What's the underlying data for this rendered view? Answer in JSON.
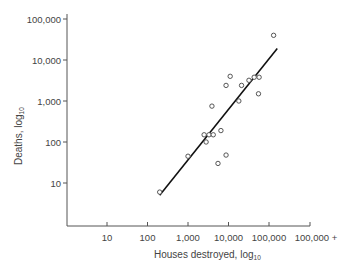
{
  "chart_data": {
    "type": "scatter",
    "title": "",
    "xlabel": "Houses destroyed, log",
    "xlabel_subscript": "10",
    "ylabel": "Deaths, log",
    "ylabel_subscript": "10",
    "xscale": "log",
    "yscale": "log",
    "xlim": [
      1,
      1000000
    ],
    "ylim": [
      1,
      100000
    ],
    "grid": false,
    "legend": null,
    "x_ticks": [
      {
        "value": 10,
        "label": "10"
      },
      {
        "value": 100,
        "label": "100"
      },
      {
        "value": 1000,
        "label": "1,000"
      },
      {
        "value": 10000,
        "label": "10,000"
      },
      {
        "value": 100000,
        "label": "100,000"
      },
      {
        "value": 1000000,
        "label": "100,000 +"
      }
    ],
    "y_ticks": [
      {
        "value": 10,
        "label": "10"
      },
      {
        "value": 100,
        "label": "100"
      },
      {
        "value": 1000,
        "label": "1,000"
      },
      {
        "value": 10000,
        "label": "10,000"
      },
      {
        "value": 100000,
        "label": "100,000"
      }
    ],
    "series": [
      {
        "name": "Events",
        "marker": "open-circle",
        "points": [
          {
            "x": 200,
            "y": 6
          },
          {
            "x": 1000,
            "y": 45
          },
          {
            "x": 2500,
            "y": 150
          },
          {
            "x": 3300,
            "y": 150
          },
          {
            "x": 4200,
            "y": 150
          },
          {
            "x": 2800,
            "y": 100
          },
          {
            "x": 6500,
            "y": 190
          },
          {
            "x": 3900,
            "y": 750
          },
          {
            "x": 5500,
            "y": 30
          },
          {
            "x": 8700,
            "y": 48
          },
          {
            "x": 8700,
            "y": 2400
          },
          {
            "x": 11000,
            "y": 4000
          },
          {
            "x": 18000,
            "y": 1000
          },
          {
            "x": 21000,
            "y": 2400
          },
          {
            "x": 32000,
            "y": 3200
          },
          {
            "x": 43000,
            "y": 3800
          },
          {
            "x": 57000,
            "y": 3800
          },
          {
            "x": 55000,
            "y": 1500
          },
          {
            "x": 130000,
            "y": 40000
          }
        ]
      },
      {
        "name": "Regression line",
        "type": "line",
        "points": [
          {
            "x": 200,
            "y": 5
          },
          {
            "x": 160000,
            "y": 19000
          }
        ]
      }
    ]
  },
  "axes": {
    "x_title": "Houses destroyed, log",
    "x_title_sub": "10",
    "y_title": "Deaths, log",
    "y_title_sub": "10"
  }
}
